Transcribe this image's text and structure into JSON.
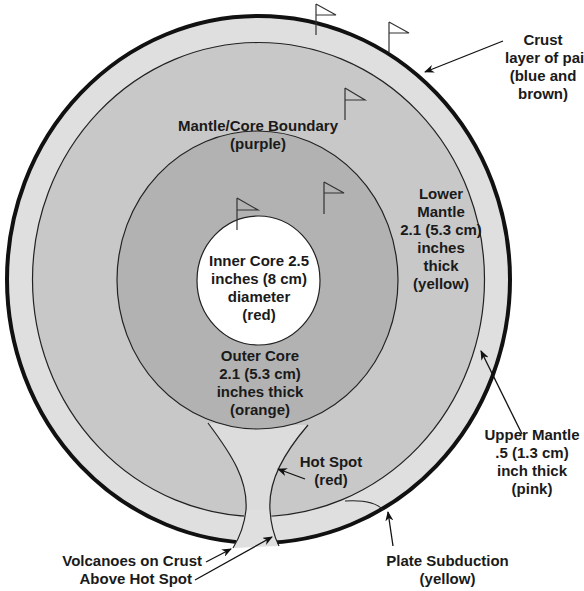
{
  "diagram": {
    "colors": {
      "upper_mantle_band": "#dfdfdf",
      "lower_mantle": "#c8c8c8",
      "outer_core": "#b2b2b2",
      "inner_core": "#ffffff",
      "outline": "#111111"
    },
    "labels": {
      "mantle_core_boundary": [
        "Mantle/Core Boundary",
        "(purple)"
      ],
      "crust": [
        "Crust",
        "layer of paint",
        "(blue and",
        "brown)"
      ],
      "lower_mantle": [
        "Lower",
        "Mantle",
        "2.1 (5.3 cm)",
        "inches",
        "thick",
        "(yellow)"
      ],
      "inner_core": [
        "Inner Core 2.5",
        "inches (8 cm)",
        "diameter",
        "(red)"
      ],
      "outer_core": [
        "Outer Core",
        "2.1 (5.3 cm)",
        "inches thick",
        "(orange)"
      ],
      "upper_mantle": [
        "Upper Mantle",
        ".5 (1.3 cm)",
        "inch thick",
        "(pink)"
      ],
      "hot_spot": [
        "Hot Spot",
        "(red)"
      ],
      "volcanoes": [
        "Volcanoes on Crust",
        "Above Hot Spot"
      ],
      "plate_subduction": [
        "Plate Subduction",
        "(yellow)"
      ]
    },
    "flags": [
      {
        "x": 316,
        "y": 4
      },
      {
        "x": 389,
        "y": 22
      },
      {
        "x": 345,
        "y": 88
      },
      {
        "x": 324,
        "y": 182
      },
      {
        "x": 237,
        "y": 198
      }
    ]
  }
}
